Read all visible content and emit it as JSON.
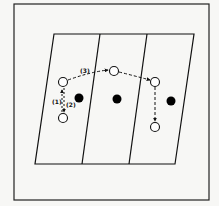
{
  "diagram": {
    "frame": {
      "x": 14,
      "y": 4,
      "w": 195,
      "h": 196
    },
    "surface": {
      "top_left": [
        54,
        34
      ],
      "top_right": [
        194,
        34
      ],
      "bottom_left": [
        35,
        164
      ],
      "bottom_right": [
        175,
        164
      ],
      "dividers": [
        [
          [
            100,
            34
          ],
          [
            82,
            164
          ]
        ],
        [
          [
            147,
            34
          ],
          [
            129,
            164
          ]
        ]
      ]
    },
    "open_sites": [
      {
        "id": "a",
        "cx": 63,
        "cy": 82
      },
      {
        "id": "b",
        "cx": 114,
        "cy": 71
      },
      {
        "id": "c",
        "cx": 155,
        "cy": 82
      },
      {
        "id": "d",
        "cx": 63,
        "cy": 118
      },
      {
        "id": "e",
        "cx": 155,
        "cy": 127
      }
    ],
    "filled_sites": [
      {
        "cx": 79,
        "cy": 98
      },
      {
        "cx": 117,
        "cy": 99
      },
      {
        "cx": 171,
        "cy": 101
      }
    ],
    "labels": [
      {
        "text": "(1)",
        "x": 54,
        "y": 103
      },
      {
        "text": "(2)",
        "x": 66,
        "y": 106
      },
      {
        "text": "(3)",
        "x": 80,
        "y": 73
      }
    ],
    "colors": {
      "line": "#111111",
      "background": "#f7f7f5",
      "fill": "#000000"
    }
  }
}
